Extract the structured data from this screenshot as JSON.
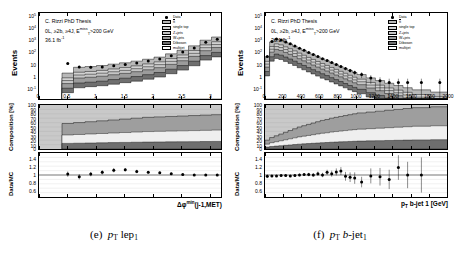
{
  "figure": {
    "caption_e": "(e)  p_T lep_1",
    "caption_f": "(f)  p_T b-jet_1"
  },
  "common": {
    "annotations": {
      "line1": "C. Rizzi PhD Thesis",
      "line2_prefix": "0L, ≥2b, ≥4J, E",
      "line2_sup": "miss",
      "line2_sub": "T",
      "line2_suffix": ">200 GeV",
      "line3": "36.1 fb",
      "line3_sup": "-1"
    },
    "legend": [
      {
        "label": "Data",
        "type": "marker",
        "color": "#000000"
      },
      {
        "label": "tt",
        "overline": true,
        "color": "#b8b8b8"
      },
      {
        "label": "single top",
        "color": "#d0d0d0"
      },
      {
        "label": "Z+jets",
        "color": "#c4c4c4"
      },
      {
        "label": "W+jets",
        "color": "#9a9a9a"
      },
      {
        "label": "Diboson",
        "color": "#707070"
      },
      {
        "label": "multijet",
        "color": "#ffffff"
      }
    ],
    "ylabel_main": "Events",
    "ylabel_comp": "Composition [%]",
    "ylabel_ratio": "Data/MC",
    "ylabels_main": [
      "10⁵",
      "10⁴",
      "10³",
      "10²",
      "10",
      "1",
      "10⁻¹"
    ],
    "ylabels_comp": [
      "100",
      "90",
      "80",
      "70",
      "60",
      "50",
      "40",
      "30",
      "20",
      "10",
      "0"
    ],
    "ylabels_ratio": [
      "1.4",
      "1.2",
      "1",
      "0.8",
      "0.6"
    ]
  },
  "chart_data": [
    {
      "id": "plot-e",
      "type": "bar",
      "title": "C. Rizzi PhD Thesis",
      "xlabel": "Δφ^min(j-1,MET)",
      "ylabel": "Events",
      "yscale": "log",
      "ylim": [
        0.1,
        300000
      ],
      "xlim": [
        0,
        3.2
      ],
      "xticks": [
        0,
        0.5,
        1,
        1.5,
        2,
        2.5,
        3
      ],
      "xticklabels": [
        "0",
        "0.5",
        "1",
        "1.5",
        "2",
        "2.5",
        "3"
      ],
      "grid": false,
      "legend_position": "upper right",
      "bin_edges": [
        0.4,
        0.6,
        0.8,
        1.0,
        1.2,
        1.4,
        1.6,
        1.8,
        2.0,
        2.2,
        2.4,
        2.6,
        2.8,
        3.0,
        3.2
      ],
      "series": [
        {
          "name": "tt",
          "values": [
            5.0,
            14,
            16,
            19,
            24,
            30,
            40,
            55,
            80,
            140,
            260,
            560,
            1500,
            2600
          ]
        },
        {
          "name": "single top",
          "values": [
            1.5,
            4.0,
            4.5,
            5.5,
            7.0,
            9.0,
            12,
            17,
            24,
            42,
            78,
            170,
            450,
            780
          ]
        },
        {
          "name": "Z+jets",
          "values": [
            1.0,
            2.6,
            3.0,
            3.6,
            4.6,
            5.8,
            7.8,
            11,
            16,
            28,
            52,
            112,
            300,
            520
          ]
        },
        {
          "name": "W+jets",
          "values": [
            0.8,
            2.2,
            2.5,
            3.0,
            3.8,
            4.8,
            6.5,
            9.0,
            13,
            23,
            43,
            93,
            250,
            430
          ]
        },
        {
          "name": "Diboson",
          "values": [
            0.35,
            0.9,
            1.0,
            1.2,
            1.6,
            2.0,
            2.7,
            3.7,
            5.4,
            9.5,
            18,
            38,
            100,
            175
          ]
        },
        {
          "name": "multijet",
          "values": [
            0.3,
            0.7,
            0.85,
            1.0,
            1.3,
            1.7,
            2.2,
            3.1,
            4.5,
            8.0,
            15,
            32,
            85,
            148
          ]
        }
      ],
      "data_points": {
        "x": [
          0.5,
          0.7,
          0.9,
          1.1,
          1.3,
          1.5,
          1.7,
          1.9,
          2.1,
          2.3,
          2.5,
          2.7,
          2.9,
          3.1
        ],
        "y": [
          48,
          26,
          25,
          26,
          32,
          40,
          52,
          72,
          105,
          180,
          340,
          700,
          1900,
          3200
        ]
      },
      "ratio": {
        "x": [
          0.5,
          0.7,
          0.9,
          1.1,
          1.3,
          1.5,
          1.7,
          1.9,
          2.1,
          2.3,
          2.5,
          2.7,
          2.9,
          3.1
        ],
        "y": [
          1.02,
          0.96,
          1.02,
          1.06,
          1.11,
          1.12,
          1.08,
          1.06,
          1.05,
          1.03,
          1.01,
          1.0,
          1.0,
          1.0
        ],
        "yerr": [
          0.06,
          0.06,
          0.05,
          0.05,
          0.05,
          0.04,
          0.04,
          0.03,
          0.03,
          0.03,
          0.02,
          0.02,
          0.02,
          0.02
        ],
        "ylim": [
          0.5,
          1.5
        ],
        "reference": 1.0
      },
      "composition": {
        "x": [
          0.5,
          0.7,
          0.9,
          1.1,
          1.3,
          1.5,
          1.7,
          1.9,
          2.1,
          2.3,
          2.5,
          2.7,
          2.9,
          3.1
        ],
        "ttbar_pct": [
          58,
          60,
          62,
          64,
          66,
          68,
          70,
          72,
          73,
          74,
          75,
          76,
          77,
          78
        ],
        "other_pct": [
          42,
          40,
          38,
          36,
          34,
          32,
          30,
          28,
          27,
          26,
          25,
          24,
          23,
          22
        ],
        "ylim": [
          0,
          100
        ]
      }
    },
    {
      "id": "plot-f",
      "type": "bar",
      "title": "C. Rizzi PhD Thesis",
      "xlabel": "p_T b-jet 1 [GeV]",
      "ylabel": "Events",
      "yscale": "log",
      "ylim": [
        0.05,
        300000
      ],
      "xlim": [
        0,
        2000
      ],
      "xticks": [
        0,
        200,
        400,
        600,
        800,
        1000,
        1200,
        1400,
        1600,
        1800,
        2000
      ],
      "xticklabels": [
        "0",
        "200",
        "400",
        "600",
        "800",
        "1000",
        "1200",
        "1400",
        "1600",
        "1800",
        "2000"
      ],
      "grid": false,
      "legend_position": "upper right",
      "bin_edges": [
        0,
        50,
        100,
        150,
        200,
        250,
        300,
        350,
        400,
        450,
        500,
        550,
        600,
        650,
        700,
        750,
        800,
        850,
        900,
        950,
        1000,
        1100,
        1200,
        1300,
        1400,
        1500,
        1600,
        1800,
        2000
      ],
      "series": [
        {
          "name": "tt",
          "values": [
            60,
            900,
            1450,
            1200,
            850,
            600,
            400,
            270,
            185,
            125,
            86,
            60,
            42,
            29,
            20,
            14,
            10,
            7.0,
            5.0,
            3.5,
            2.4,
            1.3,
            0.8,
            0.5,
            0.33,
            0.22,
            0.15,
            0.1
          ]
        },
        {
          "name": "single top",
          "values": [
            18,
            260,
            420,
            350,
            245,
            175,
            118,
            78,
            53,
            36,
            25,
            17,
            12,
            8.4,
            5.8,
            4.1,
            2.9,
            2.0,
            1.4,
            1.0,
            0.7,
            0.38,
            0.23,
            0.14,
            0.095,
            0.064,
            0.043,
            0.029
          ]
        },
        {
          "name": "Z+jets",
          "values": [
            12,
            175,
            285,
            235,
            165,
            118,
            80,
            53,
            36,
            24,
            17,
            12,
            8.1,
            5.7,
            3.9,
            2.8,
            1.9,
            1.4,
            0.96,
            0.67,
            0.47,
            0.26,
            0.16,
            0.096,
            0.064,
            0.043,
            0.029,
            0.019
          ]
        },
        {
          "name": "W+jets",
          "values": [
            9,
            140,
            230,
            190,
            133,
            95,
            64,
            43,
            29,
            20,
            13.5,
            9.4,
            6.5,
            4.6,
            3.2,
            2.2,
            1.6,
            1.1,
            0.77,
            0.54,
            0.38,
            0.21,
            0.13,
            0.077,
            0.052,
            0.035,
            0.023,
            0.016
          ]
        },
        {
          "name": "Diboson",
          "values": [
            4,
            58,
            95,
            78,
            55,
            39,
            26,
            17.5,
            12,
            8.1,
            5.6,
            3.9,
            2.7,
            1.9,
            1.3,
            0.92,
            0.65,
            0.45,
            0.32,
            0.22,
            0.16,
            0.086,
            0.052,
            0.032,
            0.021,
            0.014,
            0.01,
            0.0065
          ]
        },
        {
          "name": "multijet",
          "values": [
            3.3,
            48,
            79,
            65,
            46,
            32,
            22,
            14.5,
            10,
            6.8,
            4.7,
            3.2,
            2.2,
            1.6,
            1.1,
            0.77,
            0.54,
            0.38,
            0.26,
            0.19,
            0.13,
            0.072,
            0.043,
            0.026,
            0.018,
            0.012,
            0.008,
            0.0054
          ]
        }
      ],
      "data_points": {
        "x": [
          25,
          75,
          125,
          175,
          225,
          275,
          325,
          375,
          425,
          475,
          525,
          575,
          625,
          675,
          725,
          775,
          825,
          875,
          925,
          975,
          1050,
          1150,
          1250,
          1350,
          1450,
          1550,
          1700,
          1900
        ],
        "y": [
          110,
          1700,
          2700,
          2250,
          1580,
          1120,
          750,
          500,
          340,
          230,
          158,
          110,
          76,
          53,
          37,
          26,
          18,
          12.5,
          8.8,
          6.2,
          4.3,
          2.3,
          1.4,
          1.0,
          1.0,
          1.0,
          1.0,
          1.0
        ]
      },
      "ratio": {
        "x": [
          25,
          75,
          125,
          175,
          225,
          275,
          325,
          375,
          425,
          475,
          525,
          575,
          625,
          675,
          725,
          775,
          825,
          875,
          925,
          975,
          1050,
          1150,
          1250,
          1350,
          1450,
          1550,
          1700
        ],
        "y": [
          0.97,
          0.98,
          0.98,
          0.99,
          0.99,
          0.98,
          0.99,
          1.0,
          1.01,
          1.01,
          1.0,
          1.03,
          1.0,
          1.06,
          1.03,
          1.07,
          1.09,
          0.97,
          0.95,
          0.93,
          0.84,
          0.98,
          0.96,
          0.9,
          1.17,
          1.0,
          1.0
        ],
        "yerr": [
          0.04,
          0.02,
          0.02,
          0.02,
          0.02,
          0.02,
          0.03,
          0.03,
          0.03,
          0.04,
          0.04,
          0.05,
          0.05,
          0.06,
          0.07,
          0.08,
          0.09,
          0.1,
          0.11,
          0.13,
          0.12,
          0.17,
          0.2,
          0.22,
          0.28,
          0.3,
          0.4
        ],
        "ylim": [
          0.5,
          1.5
        ],
        "reference": 1.0
      },
      "composition": {
        "x": [
          25,
          75,
          125,
          175,
          225,
          275,
          325,
          375,
          425,
          475,
          525,
          575,
          625,
          675,
          725,
          775,
          825,
          875,
          925,
          975,
          1050,
          1150,
          1250,
          1350,
          1450,
          1550,
          1700,
          1900
        ],
        "ttbar_pct": [
          20,
          26,
          30,
          34,
          38,
          42,
          46,
          50,
          53,
          56,
          59,
          62,
          65,
          67,
          70,
          72,
          74,
          76,
          78,
          80,
          82,
          84,
          86,
          88,
          90,
          92,
          94,
          96
        ],
        "other_pct": [
          80,
          74,
          70,
          66,
          62,
          58,
          54,
          50,
          47,
          44,
          41,
          38,
          35,
          33,
          30,
          28,
          26,
          24,
          22,
          20,
          18,
          16,
          14,
          12,
          10,
          8,
          6,
          4
        ],
        "ylim": [
          0,
          100
        ]
      }
    }
  ]
}
